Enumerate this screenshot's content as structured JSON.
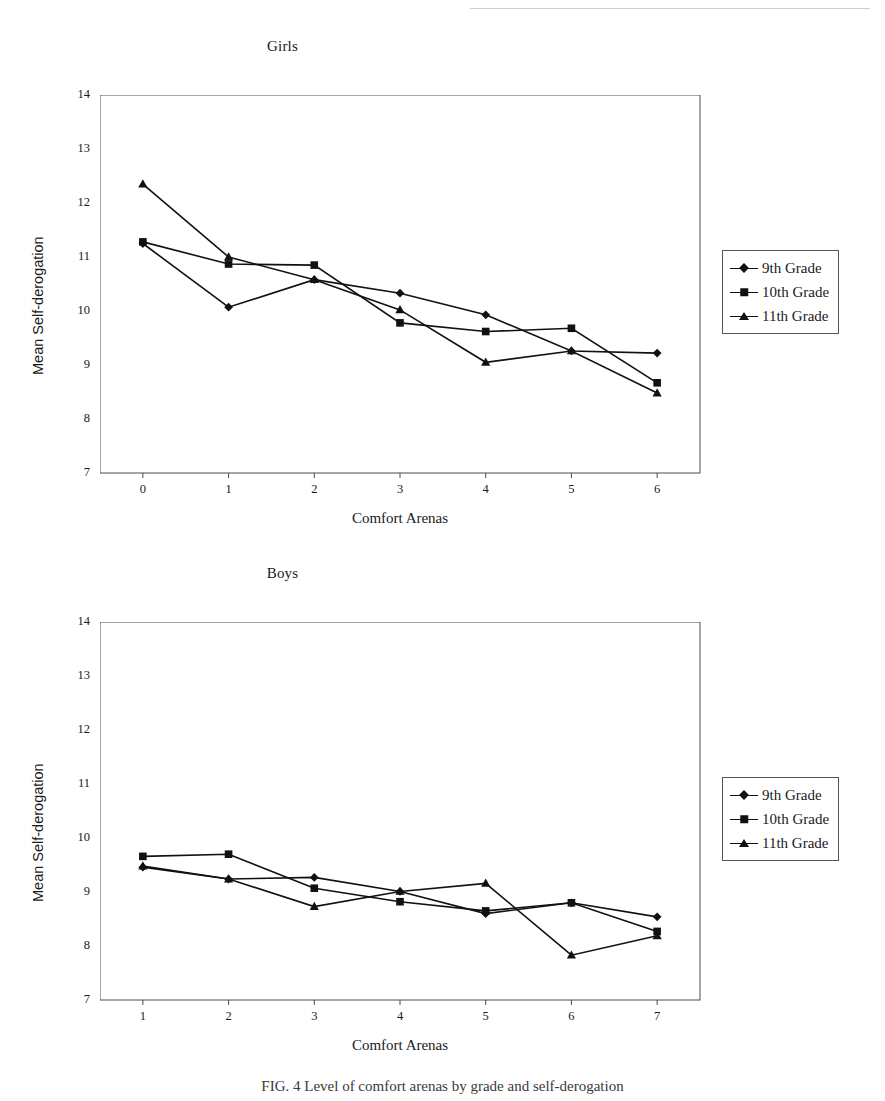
{
  "page": {
    "caption": "FIG. 4 Level of comfort arenas by grade and self-derogation"
  },
  "legend_items": [
    {
      "label": "9th Grade",
      "marker": "diamond-marker"
    },
    {
      "label": "10th Grade",
      "marker": "square-marker"
    },
    {
      "label": "11th Grade",
      "marker": "triangle-marker"
    }
  ],
  "chart_data": [
    {
      "type": "line",
      "title": "Girls",
      "xlabel": "Comfort Arenas",
      "ylabel": "Mean Self-derogation",
      "x": [
        0,
        1,
        2,
        3,
        4,
        5,
        6
      ],
      "xticks": [
        "0",
        "1",
        "2",
        "3",
        "4",
        "5",
        "6"
      ],
      "yticks": [
        "7",
        "8",
        "9",
        "10",
        "11",
        "12",
        "13",
        "14"
      ],
      "xlim": [
        -0.5,
        6.5
      ],
      "ylim": [
        7,
        14
      ],
      "grid": false,
      "legend_position": "right",
      "series": [
        {
          "name": "9th Grade",
          "marker": "diamond",
          "values": [
            11.25,
            10.07,
            10.58,
            10.33,
            9.93,
            9.26,
            9.22
          ]
        },
        {
          "name": "10th Grade",
          "marker": "square",
          "values": [
            11.28,
            10.87,
            10.85,
            9.78,
            9.62,
            9.68,
            8.67
          ]
        },
        {
          "name": "11th Grade",
          "marker": "triangle",
          "values": [
            12.35,
            11.0,
            10.58,
            10.02,
            9.05,
            9.26,
            8.48
          ]
        }
      ]
    },
    {
      "type": "line",
      "title": "Boys",
      "xlabel": "Comfort Arenas",
      "ylabel": "Mean Self-derogation",
      "x": [
        1,
        2,
        3,
        4,
        5,
        6,
        7
      ],
      "xticks": [
        "1",
        "2",
        "3",
        "4",
        "5",
        "6",
        "7"
      ],
      "yticks": [
        "7",
        "8",
        "9",
        "10",
        "11",
        "12",
        "13",
        "14"
      ],
      "xlim": [
        0.5,
        7.5
      ],
      "ylim": [
        7,
        14
      ],
      "grid": false,
      "legend_position": "right",
      "series": [
        {
          "name": "9th Grade",
          "marker": "diamond",
          "values": [
            9.46,
            9.24,
            9.27,
            9.01,
            8.6,
            8.8,
            8.54
          ]
        },
        {
          "name": "10th Grade",
          "marker": "square",
          "values": [
            9.66,
            9.7,
            9.07,
            8.82,
            8.65,
            8.8,
            8.27
          ]
        },
        {
          "name": "11th Grade",
          "marker": "triangle",
          "values": [
            9.48,
            9.24,
            8.73,
            9.01,
            9.16,
            7.83,
            8.19
          ]
        }
      ]
    }
  ]
}
